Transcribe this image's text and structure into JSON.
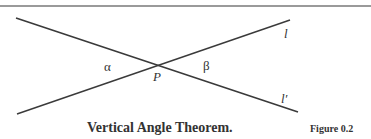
{
  "figure": {
    "caption": "Vertical Angle Theorem.",
    "number": "Figure 0.2",
    "labels": {
      "line_l": "l",
      "line_l_prime": "l′",
      "point": "P",
      "angle_alpha": "α",
      "angle_beta": "β"
    },
    "lines": [
      {
        "name": "l",
        "x1": 17,
        "y1": 114,
        "x2": 290,
        "y2": 20
      },
      {
        "name": "l′",
        "x1": 16,
        "y1": 18,
        "x2": 298,
        "y2": 112
      }
    ],
    "stroke_color": "#3a3a3a"
  }
}
